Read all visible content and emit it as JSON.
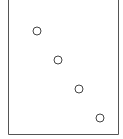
{
  "chart_data": {
    "type": "scatter",
    "title": "",
    "xlabel": "",
    "ylabel": "",
    "grid": false,
    "legend": null,
    "frame": {
      "left": 8.5,
      "right": 118.5,
      "top": -1,
      "bottom": 134.5,
      "color": "#555555"
    },
    "marker": {
      "shape": "open-circle",
      "radius": 4,
      "stroke": "#444444"
    },
    "points": [
      {
        "x": 1,
        "y": 4
      },
      {
        "x": 2,
        "y": 3
      },
      {
        "x": 3,
        "y": 2
      },
      {
        "x": 4,
        "y": 1
      }
    ],
    "pixel_points": [
      {
        "cx": 37,
        "cy": 31
      },
      {
        "cx": 58,
        "cy": 60
      },
      {
        "cx": 79,
        "cy": 89
      },
      {
        "cx": 100,
        "cy": 118
      }
    ]
  }
}
